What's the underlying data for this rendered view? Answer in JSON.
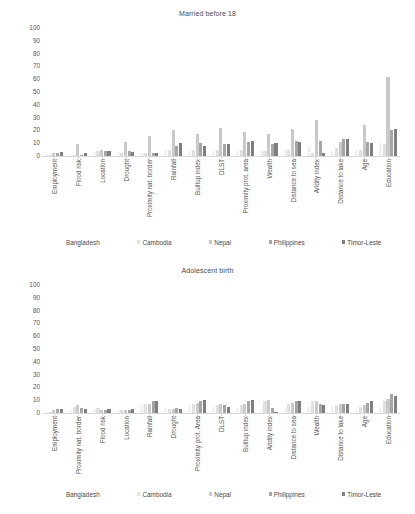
{
  "palette": {
    "bangladesh": "#f2f2f2",
    "cambodia": "#e0e0e0",
    "nepal": "#c9c9c9",
    "philippines": "#a6a6a6",
    "timor_leste": "#7f7f7f",
    "axis": "#d9d9d9",
    "text": "#4a4a4a"
  },
  "legend": {
    "items": [
      {
        "label": "Bangladesh",
        "color": "#f2f2f2"
      },
      {
        "label": "Cambodia",
        "color": "#e0e0e0"
      },
      {
        "label": "Nepal",
        "color": "#c9c9c9"
      },
      {
        "label": "Philippines",
        "color": "#a6a6a6"
      },
      {
        "label": "Timor-Leste",
        "color": "#7f7f7f"
      }
    ]
  },
  "chart_data": [
    {
      "id": "married_before_18",
      "type": "bar",
      "title": "Married before 18",
      "xlabel": "",
      "ylabel": "",
      "ylim": [
        0,
        100
      ],
      "yticks": [
        100,
        90,
        80,
        70,
        60,
        50,
        40,
        30,
        20,
        10,
        0
      ],
      "grid": false,
      "legend_position": "bottom",
      "categories": [
        "Employment",
        "Flood risk",
        "Location",
        "Drought",
        "Proximity nat. border",
        "Rainfall",
        "Builtup index",
        "DLST",
        "Proximity prot. area",
        "Wealth",
        "Distance to sea",
        "Aridity index",
        "Distance to lake",
        "Age",
        "Education"
      ],
      "series": [
        {
          "name": "Bangladesh",
          "color": "#f2f2f2",
          "values": [
            1,
            1,
            3,
            3,
            2,
            5,
            4,
            4,
            4,
            4,
            5,
            7,
            4,
            5,
            10
          ]
        },
        {
          "name": "Cambodia",
          "color": "#e0e0e0",
          "values": [
            1,
            1,
            4,
            2,
            2,
            5,
            5,
            5,
            5,
            4,
            5,
            2,
            6,
            5,
            9
          ]
        },
        {
          "name": "Nepal",
          "color": "#c9c9c9",
          "values": [
            2,
            9,
            5,
            11,
            16,
            20,
            17,
            22,
            19,
            17,
            21,
            28,
            11,
            24,
            62
          ]
        },
        {
          "name": "Philippines",
          "color": "#a6a6a6",
          "values": [
            2,
            1,
            4,
            4,
            2,
            8,
            10,
            9,
            11,
            9,
            12,
            12,
            13,
            11,
            20
          ]
        },
        {
          "name": "Timor-Leste",
          "color": "#7f7f7f",
          "values": [
            3,
            2,
            4,
            3,
            2,
            10,
            8,
            9,
            12,
            10,
            11,
            2,
            13,
            10,
            21
          ]
        }
      ]
    },
    {
      "id": "adolescent_birth",
      "type": "bar",
      "title": "Adolescent birth",
      "xlabel": "",
      "ylabel": "",
      "ylim": [
        0,
        100
      ],
      "yticks": [
        100,
        90,
        80,
        70,
        60,
        50,
        40,
        30,
        20,
        10,
        0
      ],
      "grid": false,
      "legend_position": "bottom",
      "categories": [
        "Employment",
        "Proximity nat. border",
        "Flood risk",
        "Location",
        "Rainfall",
        "Drought",
        "Proximity prot. Area",
        "DLST",
        "Builtup index",
        "Aridity index",
        "Distance to sea",
        "Wealth",
        "Distance to lake",
        "Age",
        "Education"
      ],
      "series": [
        {
          "name": "Bangladesh",
          "color": "#f2f2f2",
          "values": [
            1,
            2,
            3,
            2,
            6,
            4,
            6,
            5,
            4,
            3,
            5,
            5,
            5,
            3,
            5
          ]
        },
        {
          "name": "Cambodia",
          "color": "#e0e0e0",
          "values": [
            1,
            5,
            4,
            2,
            7,
            3,
            7,
            6,
            6,
            9,
            7,
            9,
            6,
            5,
            9
          ]
        },
        {
          "name": "Nepal",
          "color": "#c9c9c9",
          "values": [
            2,
            6,
            2,
            2,
            7,
            3,
            8,
            7,
            7,
            10,
            8,
            9,
            7,
            6,
            11
          ]
        },
        {
          "name": "Philippines",
          "color": "#a6a6a6",
          "values": [
            3,
            4,
            2,
            2,
            9,
            4,
            9,
            6,
            9,
            4,
            9,
            7,
            7,
            8,
            15
          ]
        },
        {
          "name": "Timor-Leste",
          "color": "#7f7f7f",
          "values": [
            3,
            3,
            3,
            3,
            9,
            3,
            10,
            5,
            10,
            1,
            9,
            6,
            7,
            9,
            13
          ]
        }
      ]
    }
  ]
}
